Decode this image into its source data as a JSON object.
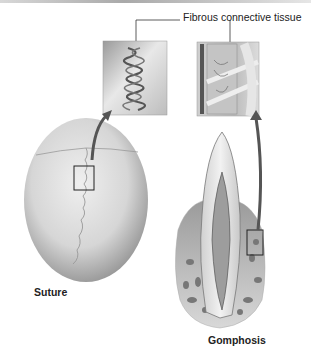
{
  "figure": {
    "callout_label": "Fibrous connective tissue",
    "panels": [
      {
        "id": "suture",
        "label": "Suture",
        "structure": "skull",
        "inset": "interlocking-fibers"
      },
      {
        "id": "gomphosis",
        "label": "Gomphosis",
        "structure": "tooth-in-socket",
        "inset": "periodontal-ligament"
      }
    ]
  }
}
